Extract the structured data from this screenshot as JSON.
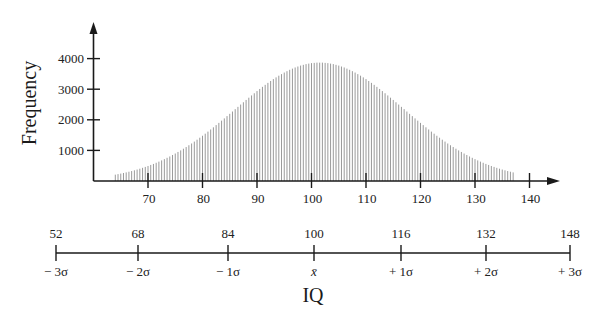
{
  "chart_data": {
    "type": "bar",
    "title": "",
    "xlabel": "IQ",
    "ylabel": "Frequency",
    "x_ticks": [
      70,
      80,
      90,
      100,
      110,
      120,
      130,
      140
    ],
    "y_ticks": [
      1000,
      2000,
      3000,
      4000
    ],
    "xlim": [
      58,
      146
    ],
    "ylim": [
      0,
      4500
    ],
    "grid": false,
    "legend": null,
    "bar_color": "#9a9a9a",
    "axis_color": "#1a1a1a",
    "x": [
      64,
      65,
      66,
      67,
      68,
      69,
      70,
      71,
      72,
      73,
      74,
      75,
      76,
      77,
      78,
      79,
      80,
      81,
      82,
      83,
      84,
      85,
      86,
      87,
      88,
      89,
      90,
      91,
      92,
      93,
      94,
      95,
      96,
      97,
      98,
      99,
      100,
      101,
      102,
      103,
      104,
      105,
      106,
      107,
      108,
      109,
      110,
      111,
      112,
      113,
      114,
      115,
      116,
      117,
      118,
      119,
      120,
      121,
      122,
      123,
      124,
      125,
      126,
      127,
      128,
      129,
      130,
      131,
      132,
      133,
      134,
      135,
      136,
      137
    ],
    "values": [
      207,
      242,
      281,
      325,
      374,
      430,
      491,
      558,
      633,
      714,
      802,
      898,
      1000,
      1110,
      1226,
      1350,
      1479,
      1614,
      1754,
      1899,
      2046,
      2195,
      2347,
      2498,
      2649,
      2796,
      2939,
      3077,
      3207,
      3330,
      3442,
      3544,
      3634,
      3710,
      3772,
      3820,
      3852,
      3868,
      3868,
      3852,
      3820,
      3772,
      3710,
      3634,
      3544,
      3442,
      3330,
      3207,
      3077,
      2939,
      2796,
      2649,
      2498,
      2347,
      2195,
      2046,
      1899,
      1754,
      1614,
      1479,
      1350,
      1226,
      1110,
      1000,
      898,
      802,
      714,
      633,
      558,
      491,
      430,
      374,
      325,
      281
    ],
    "sigma_scale": {
      "values": [
        "52",
        "68",
        "84",
        "100",
        "116",
        "132",
        "148"
      ],
      "labels": [
        "− 3σ",
        "− 2σ",
        "− 1σ",
        "x̄",
        "+ 1σ",
        "+ 2σ",
        "+ 3σ"
      ]
    }
  }
}
